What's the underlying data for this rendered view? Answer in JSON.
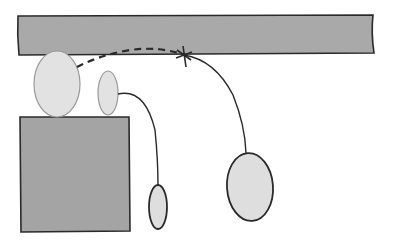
{
  "diagram": {
    "colors": {
      "background": "#ffffff",
      "bar_fill": "#a9a9a9",
      "block_fill": "#a4a4a4",
      "ellipse_fill": "#dedede",
      "stroke": "#2a2a2a",
      "light_stroke": "#9a9a9a"
    },
    "elements": {
      "top_bar": {
        "x": 18,
        "y": 15,
        "w": 356,
        "h": 38
      },
      "block": {
        "x": 20,
        "y": 117,
        "w": 110,
        "h": 115
      },
      "ellipse_large_left": {
        "cx": 57,
        "cy": 84,
        "rx": 23,
        "ry": 33
      },
      "ellipse_small_left": {
        "cx": 108,
        "cy": 93,
        "rx": 10,
        "ry": 22
      },
      "ellipse_hanging_small": {
        "cx": 158,
        "cy": 207,
        "rx": 9,
        "ry": 22
      },
      "ellipse_hanging_large": {
        "cx": 250,
        "cy": 186,
        "rx": 23,
        "ry": 34
      },
      "star_point": {
        "x": 184,
        "y": 55
      }
    }
  }
}
